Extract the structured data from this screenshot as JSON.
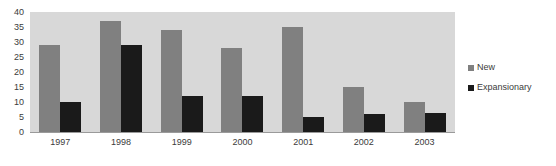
{
  "chart_data": {
    "type": "bar",
    "title": "",
    "subtitle": "",
    "xlabel": "",
    "ylabel": "",
    "categories": [
      "1997",
      "1998",
      "1999",
      "2000",
      "2001",
      "2002",
      "2003"
    ],
    "series": [
      {
        "name": "New",
        "color": "#808080",
        "values": [
          29,
          37,
          34,
          28,
          35,
          15,
          10
        ]
      },
      {
        "name": "Expansionary",
        "color": "#1a1a1a",
        "values": [
          10,
          29,
          12,
          12,
          5,
          6,
          6.5
        ]
      }
    ],
    "ylim": [
      0,
      40
    ],
    "ytick_values": [
      0,
      5,
      10,
      15,
      20,
      25,
      30,
      35,
      40
    ],
    "ytick_labels": [
      "0",
      "5",
      "10",
      "15",
      "20",
      "25",
      "30",
      "35",
      "40"
    ],
    "grid": true,
    "grid_style": "alternating-horizontal-bands",
    "band_color": "#d8d8d8",
    "plot_background": "#ffffff",
    "legend_position": "right",
    "legend": [
      {
        "label": "New",
        "swatch_color": "#808080"
      },
      {
        "label": "Expansionary",
        "swatch_color": "#1a1a1a"
      }
    ]
  }
}
